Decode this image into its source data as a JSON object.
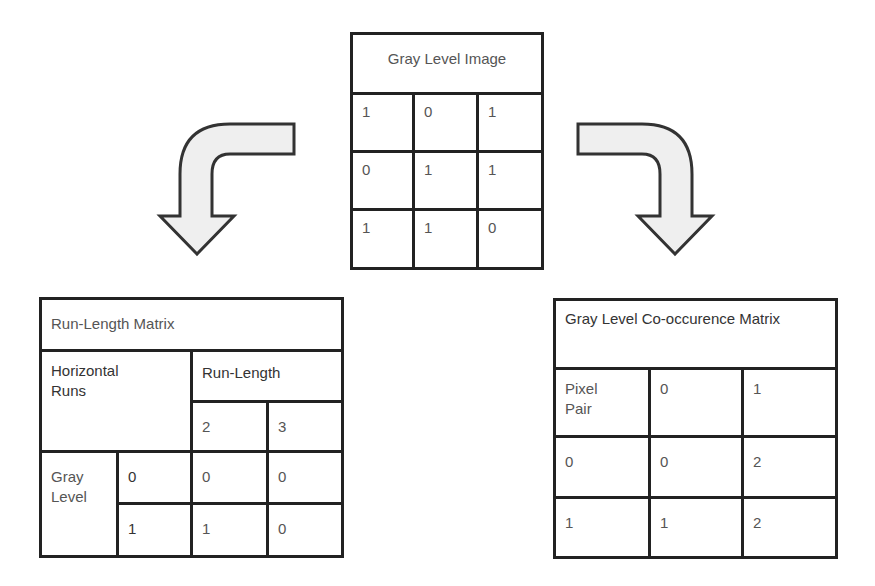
{
  "gray_level_image": {
    "title": "Gray Level Image",
    "rows": [
      [
        "1",
        "0",
        "1"
      ],
      [
        "0",
        "1",
        "1"
      ],
      [
        "1",
        "1",
        "0"
      ]
    ]
  },
  "run_length_matrix": {
    "title": "Run-Length Matrix",
    "row_header": "Horizontal Runs",
    "column_group_header": "Run-Length",
    "column_labels": [
      "2",
      "3"
    ],
    "row_group_label": "Gray Level",
    "rows": [
      {
        "label": "0",
        "values": [
          "0",
          "0"
        ]
      },
      {
        "label": "1",
        "values": [
          "1",
          "0"
        ]
      }
    ]
  },
  "glcm": {
    "title": "Gray Level Co-occurence Matrix",
    "corner_header": "Pixel Pair",
    "column_labels": [
      "0",
      "1"
    ],
    "rows": [
      {
        "label": "0",
        "values": [
          "0",
          "2"
        ]
      },
      {
        "label": "1",
        "values": [
          "1",
          "2"
        ]
      }
    ]
  },
  "arrows": {
    "left": {
      "icon": "curved-arrow-down-left-icon",
      "fill": "#efefef",
      "stroke": "#333333"
    },
    "right": {
      "icon": "curved-arrow-down-right-icon",
      "fill": "#efefef",
      "stroke": "#333333"
    }
  }
}
